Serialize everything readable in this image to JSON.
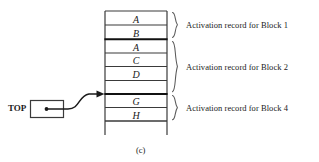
{
  "figure": {
    "caption": "(c)",
    "pointer": {
      "label": "TOP",
      "target_description": "arrow-to-stack-top"
    },
    "stack": {
      "cells": [
        {
          "letter": "A"
        },
        {
          "letter": "B"
        },
        {
          "letter": "A"
        },
        {
          "letter": "C"
        },
        {
          "letter": "D"
        },
        {
          "letter": "G"
        },
        {
          "letter": "H"
        }
      ]
    },
    "brace_labels": [
      {
        "text": "Activation record for Block 1"
      },
      {
        "text": "Activation record for Block 2"
      },
      {
        "text": "Activation record for Block 4"
      }
    ],
    "colors": {
      "line": "#3a3a3a",
      "thick_line": "#111111",
      "text": "#1a1a1a",
      "background": "#ffffff"
    }
  }
}
